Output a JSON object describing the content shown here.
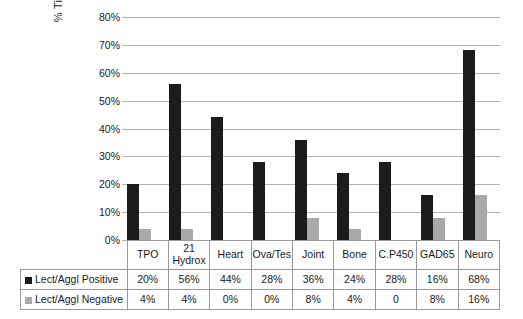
{
  "chart_data": {
    "type": "bar",
    "title": "",
    "subtitle": "",
    "xlabel": "",
    "ylabel": "% Tissue Antibodies",
    "ylim": [
      0,
      80
    ],
    "ytick_step": 10,
    "ytick_labels": [
      "0%",
      "10%",
      "20%",
      "30%",
      "40%",
      "50%",
      "60%",
      "70%",
      "80%"
    ],
    "grid": true,
    "legend_position": "table-row-labels",
    "categories": [
      "TPO",
      "21 Hydrox",
      "Heart",
      "Ova/Tes",
      "Joint",
      "Bone",
      "C.P450",
      "GAD65",
      "Neuro"
    ],
    "category_display": [
      "TPO",
      "21\nHydrox",
      "Heart",
      "Ova/Tes",
      "Joint",
      "Bone",
      "C.P450",
      "GAD65",
      "Neuro"
    ],
    "series": [
      {
        "name": "Lect/Aggl Positive",
        "color": "#1c1c1c",
        "values": [
          20,
          56,
          44,
          28,
          36,
          24,
          28,
          16,
          68
        ],
        "labels": [
          "20%",
          "56%",
          "44%",
          "28%",
          "36%",
          "24%",
          "28%",
          "16%",
          "68%"
        ]
      },
      {
        "name": "Lect/Aggl Negative",
        "color": "#a9a9a9",
        "values": [
          4,
          4,
          0,
          0,
          8,
          4,
          0,
          8,
          16
        ],
        "labels": [
          "4%",
          "4%",
          "0%",
          "0%",
          "8%",
          "4%",
          "0",
          "8%",
          "16%"
        ]
      }
    ]
  },
  "colors": {
    "positive": "#1c1c1c",
    "negative": "#a9a9a9",
    "gridline": "#b3b3b3",
    "table_border": "#9a9a9a",
    "background": "#ffffff",
    "text": "#1a1a1a"
  }
}
